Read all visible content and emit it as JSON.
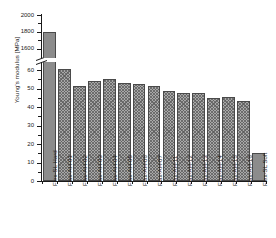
{
  "chart_data": {
    "type": "bar",
    "title": "",
    "xlabel": "",
    "ylabel": "Young's modulus [MPa]",
    "grid": false,
    "legend": "none",
    "axis_break": true,
    "ylim_lower": [
      0,
      65
    ],
    "ylim_upper": [
      1500,
      2000
    ],
    "yticks_lower": [
      "0",
      "10",
      "20",
      "30",
      "40",
      "50",
      "60"
    ],
    "yticks_upper": [
      "1600",
      "1800",
      "2000"
    ],
    "categories": [
      "Flex-SL Hard",
      "Flax-AH-01",
      "Flax-AH-02",
      "Flax-AH-03",
      "Flax-AH-04",
      "Flax-AH-05",
      "Flax-AH-06",
      "Flax-AH-07",
      "Flax-AH-11",
      "Flax-AH-12",
      "Flax-AH-13",
      "Flax-AH-14",
      "Flax-AH-15",
      "Flax-AH-16",
      "Flex-SL Soft"
    ],
    "values": [
      1800,
      60.5,
      51.5,
      54,
      55,
      53,
      52.5,
      51.5,
      48.5,
      47.5,
      47.5,
      45,
      45.5,
      43.5,
      15
    ],
    "series_name": "Young's modulus",
    "bar_style": [
      "solid",
      "hatch",
      "hatch",
      "hatch",
      "hatch",
      "hatch",
      "hatch",
      "hatch",
      "hatch",
      "hatch",
      "hatch",
      "hatch",
      "hatch",
      "hatch",
      "solid"
    ],
    "colors": {
      "solid": "#8c8c8c",
      "hatch": "#a8a8a8",
      "edge": "#4a4a4a",
      "axis": "#1a1a1a"
    }
  }
}
